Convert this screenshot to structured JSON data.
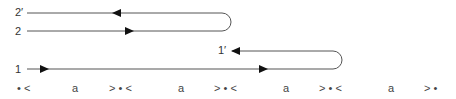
{
  "diagram": {
    "strands": [
      {
        "id": "2prime",
        "label": "2′",
        "direction": "left"
      },
      {
        "id": "2",
        "label": "2",
        "direction": "right"
      },
      {
        "id": "1prime",
        "label": "1′",
        "direction": "left"
      },
      {
        "id": "1",
        "label": "1",
        "direction": "right"
      }
    ],
    "colors": {
      "line": "#555555",
      "arrow": "#111111",
      "text": "#333333"
    },
    "sequence": [
      {
        "text": "• <",
        "x": 17
      },
      {
        "text": "a",
        "x": 72
      },
      {
        "text": "> • <",
        "x": 109
      },
      {
        "text": "a",
        "x": 178
      },
      {
        "text": "> • <",
        "x": 214
      },
      {
        "text": "a",
        "x": 283
      },
      {
        "text": "> • <",
        "x": 319
      },
      {
        "text": "a",
        "x": 388
      },
      {
        "text": "> •",
        "x": 424
      }
    ]
  }
}
